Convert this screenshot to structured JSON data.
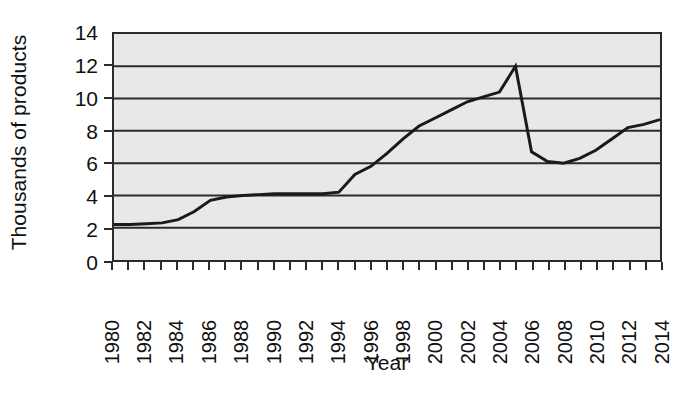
{
  "chart_data": {
    "type": "line",
    "title": "",
    "xlabel": "Year",
    "ylabel": "Thousands of products",
    "xlim": [
      1980,
      2014
    ],
    "ylim": [
      0,
      14
    ],
    "yticks": [
      0,
      2,
      4,
      6,
      8,
      10,
      12,
      14
    ],
    "ytick_labels": [
      "0",
      "2",
      "4",
      "6",
      "8",
      "10",
      "12",
      "14"
    ],
    "xticks": [
      1980,
      1982,
      1984,
      1986,
      1988,
      1990,
      1992,
      1994,
      1996,
      1998,
      2000,
      2002,
      2004,
      2006,
      2008,
      2010,
      2012,
      2014
    ],
    "xtick_labels": [
      "1980",
      "1982",
      "1984",
      "1986",
      "1988",
      "1990",
      "1992",
      "1994",
      "1996",
      "1998",
      "2000",
      "2002",
      "2004",
      "2006",
      "2008",
      "2010",
      "2012",
      "2014"
    ],
    "xtick_rotation": -90,
    "grid": "horizontal",
    "grid_color": "#2b2b2b",
    "plot_background": "#e8e8e8",
    "line_color": "#1a1a1a",
    "line_width": 3,
    "legend": "none",
    "x": [
      1980,
      1981,
      1982,
      1983,
      1984,
      1985,
      1986,
      1987,
      1988,
      1989,
      1990,
      1991,
      1992,
      1993,
      1994,
      1995,
      1996,
      1997,
      1998,
      1999,
      2000,
      2001,
      2002,
      2003,
      2004,
      2005,
      2006,
      2007,
      2008,
      2009,
      2010,
      2011,
      2012,
      2013,
      2014
    ],
    "values": [
      2.2,
      2.2,
      2.25,
      2.3,
      2.5,
      3.0,
      3.7,
      3.9,
      4.0,
      4.05,
      4.1,
      4.1,
      4.1,
      4.1,
      4.2,
      5.3,
      5.8,
      6.6,
      7.5,
      8.3,
      8.8,
      9.3,
      9.8,
      10.1,
      10.4,
      12.0,
      6.7,
      6.1,
      6.0,
      6.3,
      6.8,
      7.5,
      8.2,
      8.4,
      8.7
    ],
    "series_name": "Thousands of products"
  }
}
